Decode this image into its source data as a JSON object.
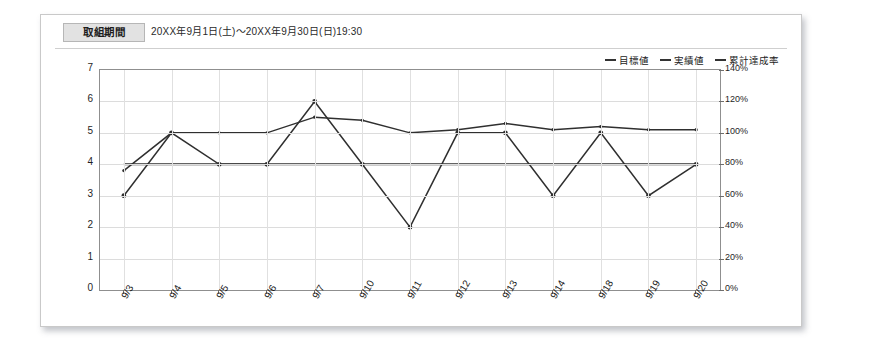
{
  "header": {
    "period_label": "取組期間",
    "period_value": "20XX年9月1日(土)〜20XX年9月30日(日)19:30"
  },
  "legend": [
    {
      "name": "target",
      "label": "目標値",
      "color": "#333333"
    },
    {
      "name": "actual",
      "label": "実績値",
      "color": "#333333"
    },
    {
      "name": "rate",
      "label": "累計達成率",
      "color": "#333333"
    }
  ],
  "chart_data": {
    "type": "line",
    "title": "",
    "xlabel": "",
    "ylabel": "",
    "grid": true,
    "legend_position": "top-right",
    "categories": [
      "9/3",
      "9/4",
      "9/5",
      "9/6",
      "9/7",
      "9/10",
      "9/11",
      "9/12",
      "9/13",
      "9/14",
      "9/18",
      "9/19",
      "9/20"
    ],
    "ylim": [
      0,
      7
    ],
    "yticks": [
      "0",
      "1",
      "2",
      "3",
      "4",
      "5",
      "6",
      "7"
    ],
    "y2lim": [
      0,
      140
    ],
    "y2ticks": [
      "0%",
      "20%",
      "40%",
      "60%",
      "80%",
      "100%",
      "120%",
      "140%"
    ],
    "series": [
      {
        "name": "目標値",
        "axis": "left",
        "values": [
          4,
          4,
          4,
          4,
          4,
          4,
          4,
          4,
          4,
          4,
          4,
          4,
          4
        ]
      },
      {
        "name": "実績値",
        "axis": "left",
        "values": [
          3,
          5,
          4,
          4,
          6,
          4,
          2,
          5,
          5,
          3,
          5,
          3,
          4
        ]
      },
      {
        "name": "累計達成率",
        "axis": "right",
        "values": [
          76,
          100,
          100,
          100,
          110,
          108,
          100,
          102,
          106,
          102,
          104,
          102,
          102
        ]
      }
    ]
  }
}
